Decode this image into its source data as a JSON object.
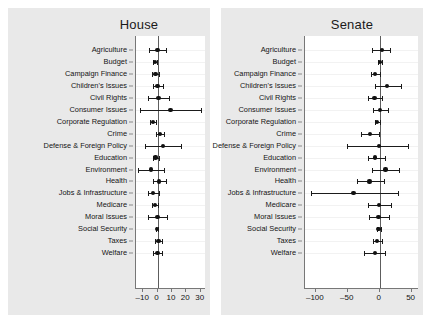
{
  "chart_data": {
    "type": "scatter",
    "title": "",
    "subtitle": "",
    "xlabel": "",
    "ylabel": "",
    "grid": true,
    "legend": "none",
    "panels": [
      {
        "title": "House",
        "xlim": [
          -15,
          33
        ],
        "xticks": [
          -10,
          0,
          10,
          20,
          30
        ],
        "xticklabels": [
          "–10",
          "0",
          "10",
          "20",
          "30"
        ],
        "categories": [
          "Agriculture",
          "Budget",
          "Campaign Finance",
          "Children's Issues",
          "Civil Rights",
          "Consumer Issues",
          "Corporate Regulation",
          "Crime",
          "Defense & Foreign Policy",
          "Education",
          "Environment",
          "Health",
          "Jobs & Infrastructure",
          "Medicare",
          "Moral Issues",
          "Social Security",
          "Taxes",
          "Welfare"
        ],
        "estimates": [
          0.0,
          -1.8,
          -1.4,
          0.0,
          0.6,
          9.0,
          -3.0,
          1.6,
          4.0,
          -1.5,
          -4.5,
          1.2,
          -3.0,
          -1.8,
          0.0,
          -0.4,
          0.6,
          0.0
        ],
        "ci_low": [
          -6.0,
          -3.2,
          -3.8,
          -3.0,
          -6.5,
          -12.5,
          -5.0,
          -1.3,
          -9.0,
          -3.5,
          -13.5,
          -3.5,
          -7.0,
          -3.8,
          -6.5,
          -1.2,
          -2.0,
          -3.5
        ],
        "ci_high": [
          6.0,
          -0.4,
          1.2,
          3.5,
          8.0,
          30.5,
          -0.8,
          4.5,
          16.0,
          1.2,
          4.5,
          6.0,
          1.2,
          0.4,
          6.5,
          0.4,
          3.2,
          3.2
        ]
      },
      {
        "title": "Senate",
        "xlim": [
          -117,
          60
        ],
        "xticks": [
          -100,
          -50,
          0,
          50
        ],
        "xticklabels": [
          "–100",
          "–50",
          "0",
          "50"
        ],
        "categories": [
          "Agriculture",
          "Budget",
          "Campaign Finance",
          "Children's Issues",
          "Civil Rights",
          "Consumer Issues",
          "Corporate Regulation",
          "Crime",
          "Defense & Foreign Policy",
          "Education",
          "Environment",
          "Health",
          "Jobs & Infrastructure",
          "Medicare",
          "Moral Issues",
          "Social Security",
          "Taxes",
          "Welfare"
        ],
        "estimates": [
          4.0,
          0.0,
          -7.0,
          12.0,
          -8.0,
          1.0,
          -4.0,
          -15.0,
          -1.0,
          -7.0,
          9.0,
          -16.0,
          -41.0,
          -1.0,
          -2.0,
          -2.0,
          -4.0,
          -7.0
        ],
        "ci_low": [
          -12.0,
          -3.0,
          -14.0,
          -8.0,
          -19.0,
          -10.0,
          -8.0,
          -29.0,
          -51.0,
          -18.0,
          -12.0,
          -36.0,
          -108.0,
          -18.0,
          -16.0,
          -5.0,
          -10.0,
          -24.0
        ],
        "ci_high": [
          16.0,
          3.0,
          1.0,
          34.0,
          3.0,
          13.0,
          1.0,
          -1.0,
          44.0,
          8.0,
          30.0,
          7.0,
          29.0,
          17.0,
          15.0,
          2.0,
          3.0,
          9.0
        ]
      }
    ]
  }
}
